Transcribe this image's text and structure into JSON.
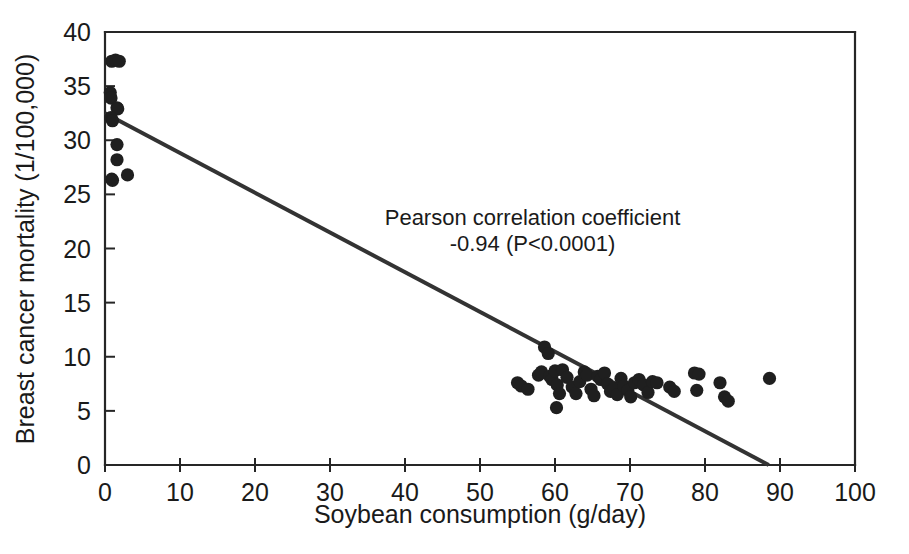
{
  "chart_data": {
    "type": "scatter",
    "title": "",
    "xlabel": "Soybean consumption (g/day)",
    "ylabel": "Breast cancer mortality (1/100,000)",
    "xlim": [
      0,
      100
    ],
    "ylim": [
      0,
      40
    ],
    "xticks": [
      0,
      10,
      20,
      30,
      40,
      50,
      60,
      70,
      80,
      90,
      100
    ],
    "yticks": [
      0,
      5,
      10,
      15,
      20,
      25,
      30,
      35,
      40
    ],
    "grid": false,
    "legend": null,
    "annotations": [
      {
        "name": "pearson-annotation",
        "line1": "Pearson correlation coefficient",
        "line2": "-0.94 (P<0.0001)",
        "x": 57,
        "y": 22.2
      }
    ],
    "series": [
      {
        "name": "Country data points",
        "marker": "filled-circle",
        "color": "#1f1f1f",
        "points": [
          [
            0.9,
            37.3
          ],
          [
            1.4,
            37.4
          ],
          [
            1.9,
            37.3
          ],
          [
            0.7,
            34.4
          ],
          [
            0.8,
            33.9
          ],
          [
            1.6,
            33.0
          ],
          [
            1.7,
            32.9
          ],
          [
            0.8,
            32.1
          ],
          [
            1.0,
            31.8
          ],
          [
            1.6,
            29.6
          ],
          [
            1.6,
            28.2
          ],
          [
            0.9,
            26.4
          ],
          [
            1.0,
            26.3
          ],
          [
            3.0,
            26.8
          ],
          [
            55.0,
            7.6
          ],
          [
            55.5,
            7.3
          ],
          [
            56.4,
            7.0
          ],
          [
            57.8,
            8.3
          ],
          [
            58.2,
            8.6
          ],
          [
            58.6,
            10.9
          ],
          [
            59.1,
            10.3
          ],
          [
            59.3,
            8.2
          ],
          [
            59.6,
            7.9
          ],
          [
            60.0,
            8.7
          ],
          [
            60.3,
            7.4
          ],
          [
            60.6,
            6.6
          ],
          [
            60.2,
            5.3
          ],
          [
            61.0,
            8.8
          ],
          [
            61.6,
            8.1
          ],
          [
            62.3,
            7.2
          ],
          [
            62.8,
            6.6
          ],
          [
            63.3,
            7.7
          ],
          [
            63.9,
            8.6
          ],
          [
            64.3,
            8.3
          ],
          [
            64.8,
            7.0
          ],
          [
            65.2,
            6.4
          ],
          [
            65.7,
            8.2
          ],
          [
            66.1,
            7.9
          ],
          [
            66.6,
            8.5
          ],
          [
            67.0,
            7.5
          ],
          [
            67.4,
            6.8
          ],
          [
            67.9,
            7.1
          ],
          [
            68.3,
            6.5
          ],
          [
            68.8,
            8.0
          ],
          [
            69.2,
            7.3
          ],
          [
            69.7,
            6.9
          ],
          [
            70.1,
            6.3
          ],
          [
            70.6,
            7.6
          ],
          [
            71.2,
            7.9
          ],
          [
            71.8,
            7.4
          ],
          [
            72.4,
            6.7
          ],
          [
            73.0,
            7.7
          ],
          [
            73.6,
            7.6
          ],
          [
            75.3,
            7.2
          ],
          [
            75.9,
            6.8
          ],
          [
            78.6,
            8.5
          ],
          [
            79.2,
            8.4
          ],
          [
            78.9,
            6.9
          ],
          [
            82.0,
            7.6
          ],
          [
            82.6,
            6.3
          ],
          [
            83.1,
            5.9
          ],
          [
            88.6,
            8.0
          ]
        ]
      }
    ],
    "fit_line": {
      "name": "linear regression line",
      "color": "#333333",
      "x_start": 0.0,
      "y_start": 32.5,
      "x_end": 88.5,
      "y_end": 0.0,
      "slope": -0.367,
      "intercept": 32.5
    },
    "pearson_r": -0.94,
    "p_value": "<0.0001"
  }
}
